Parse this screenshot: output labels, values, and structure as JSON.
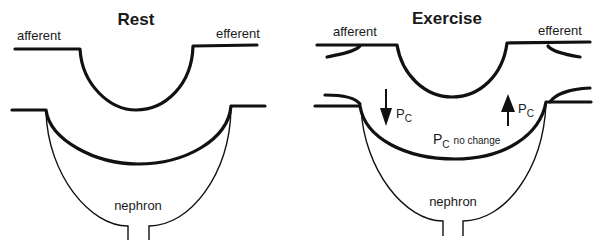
{
  "panels": [
    {
      "id": "rest",
      "title": "Rest",
      "labels": {
        "afferent": "afferent",
        "efferent": "efferent",
        "nephron": "nephron"
      }
    },
    {
      "id": "exercise",
      "title": "Exercise",
      "labels": {
        "afferent": "afferent",
        "efferent": "efferent",
        "nephron": "nephron",
        "pc_left": "P",
        "pc_left_sub": "C",
        "pc_right": "P",
        "pc_right_sub": "C",
        "pc_center": "P",
        "pc_center_sub": "C",
        "pc_center_note": "no change"
      },
      "arrows": [
        {
          "name": "afferent-pressure-arrow",
          "direction": "down"
        },
        {
          "name": "efferent-pressure-arrow",
          "direction": "up"
        }
      ]
    }
  ]
}
